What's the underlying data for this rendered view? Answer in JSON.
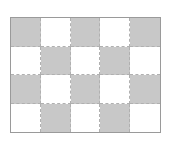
{
  "grid": {
    "rows": 4,
    "cols": 5,
    "filled_color": "#c8c8c8",
    "empty_color": "#ffffff",
    "border_color": "#9a9a9a",
    "pattern": [
      [
        1,
        0,
        1,
        0,
        1
      ],
      [
        0,
        1,
        0,
        1,
        0
      ],
      [
        1,
        0,
        1,
        0,
        1
      ],
      [
        0,
        1,
        0,
        1,
        0
      ]
    ]
  }
}
